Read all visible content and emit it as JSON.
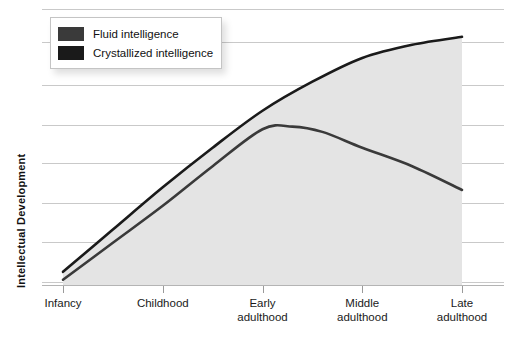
{
  "chart_data": {
    "type": "line",
    "title": "",
    "subtitle": "",
    "xlabel": "",
    "ylabel": "Intellectual Development",
    "grid": true,
    "gridline_count": 8,
    "legend_position": "top-left",
    "categories": [
      "Infancy",
      "Childhood",
      "Early adulthood",
      "Middle adulthood",
      "Late adulthood"
    ],
    "x": [
      0,
      1,
      2,
      3,
      4
    ],
    "xlim": [
      0,
      4
    ],
    "ylim": [
      0,
      100
    ],
    "series": [
      {
        "name": "Crystallized intelligence",
        "color": "#1a1a1a",
        "shaded": true,
        "values": [
          5,
          37,
          66,
          86,
          94
        ],
        "points": [
          {
            "x": 0.0,
            "y": 5
          },
          {
            "x": 0.5,
            "y": 21
          },
          {
            "x": 1.0,
            "y": 37
          },
          {
            "x": 1.5,
            "y": 52
          },
          {
            "x": 2.0,
            "y": 66
          },
          {
            "x": 2.5,
            "y": 77
          },
          {
            "x": 3.0,
            "y": 86
          },
          {
            "x": 3.5,
            "y": 91
          },
          {
            "x": 4.0,
            "y": 94
          }
        ]
      },
      {
        "name": "Fluid intelligence",
        "color": "#3a3a3a",
        "shaded": true,
        "values": [
          2,
          30,
          59,
          52,
          36
        ],
        "points": [
          {
            "x": 0.0,
            "y": 2
          },
          {
            "x": 0.5,
            "y": 16
          },
          {
            "x": 1.0,
            "y": 30
          },
          {
            "x": 1.5,
            "y": 45
          },
          {
            "x": 2.0,
            "y": 59
          },
          {
            "x": 2.3,
            "y": 60
          },
          {
            "x": 2.6,
            "y": 58
          },
          {
            "x": 3.0,
            "y": 52
          },
          {
            "x": 3.5,
            "y": 45
          },
          {
            "x": 4.0,
            "y": 36
          }
        ]
      }
    ]
  },
  "legend": {
    "items": [
      {
        "label": "Fluid intelligence",
        "color": "#3a3a3a"
      },
      {
        "label": "Crystallized intelligence",
        "color": "#1a1a1a"
      }
    ]
  },
  "axes": {
    "y_title": "Intellectual Development",
    "x_labels": [
      {
        "line1": "Infancy",
        "line2": ""
      },
      {
        "line1": "Childhood",
        "line2": ""
      },
      {
        "line1": "Early",
        "line2": "adulthood"
      },
      {
        "line1": "Middle",
        "line2": "adulthood"
      },
      {
        "line1": "Late",
        "line2": "adulthood"
      }
    ]
  },
  "colors": {
    "gridline": "#c9c9c9",
    "axis": "#b4b4b4",
    "shading": "#e4e4e4",
    "text": "#1a1a1a",
    "background": "#ffffff"
  }
}
